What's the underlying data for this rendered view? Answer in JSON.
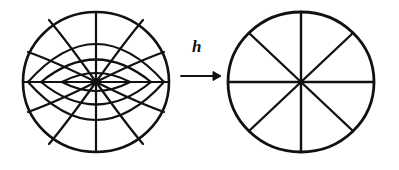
{
  "figure": {
    "kind": "conformal-mapping-diagram",
    "background_color": "#ffffff",
    "ink_color": "#111111",
    "width": 399,
    "height": 170,
    "map_arrow": {
      "label": "h",
      "glyph": "→",
      "direction": "left-to-right",
      "label_x": 196,
      "label_y": 48,
      "arrow_x1": 181,
      "arrow_x2": 219,
      "arrow_y": 76
    },
    "source_disk": {
      "name": "curvilinear-coordinate-disk",
      "center_x": 96,
      "center_y": 82,
      "radius_x": 73,
      "radius_y": 70,
      "boundary_stroke": 2.6,
      "interior_stroke": 2.2,
      "horizontal_diameter": true,
      "vertical_diameter": true,
      "lens_ring_half_heights": [
        10,
        27,
        47
      ],
      "lens_ring_half_widths": [
        34,
        55,
        68
      ],
      "arc_count_per_quadrant": 2,
      "arc_boundary_angles_deg": [
        22,
        50
      ],
      "description": "disk filled with two orthogonal families of circular arcs: lens-shaped ovals meeting at the centre and arcs fanning out to the rim"
    },
    "target_disk": {
      "name": "radial-spoke-disk",
      "center_x": 301,
      "center_y": 82,
      "radius_x": 73,
      "radius_y": 70,
      "boundary_stroke": 2.8,
      "spoke_stroke": 2.4,
      "spoke_count": 8,
      "spoke_angles_deg": [
        0,
        45,
        90,
        135,
        180,
        225,
        270,
        315
      ],
      "description": "disk divided into eight equal sectors by four straight diameters"
    }
  }
}
